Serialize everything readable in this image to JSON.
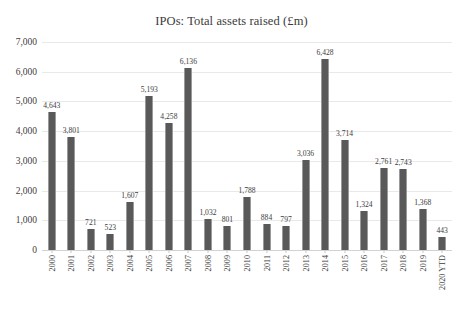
{
  "chart_data": {
    "type": "bar",
    "title": "IPOs: Total assets raised (£m)",
    "xlabel": "",
    "ylabel": "",
    "ylim": [
      0,
      7000
    ],
    "yticks": [
      0,
      1000,
      2000,
      3000,
      4000,
      5000,
      6000,
      7000
    ],
    "ytick_labels": [
      "0",
      "1,000",
      "2,000",
      "3,000",
      "4,000",
      "5,000",
      "6,000",
      "7,000"
    ],
    "grid": true,
    "legend": false,
    "bar_color": "#595959",
    "gridline_color": "#e9e9e9",
    "categories": [
      "2000",
      "2001",
      "2002",
      "2003",
      "2004",
      "2005",
      "2006",
      "2007",
      "2008",
      "2009",
      "2010",
      "2011",
      "2012",
      "2013",
      "2014",
      "2015",
      "2016",
      "2017",
      "2018",
      "2019",
      "2020 YTD"
    ],
    "values": [
      4643,
      3801,
      721,
      523,
      1607,
      5193,
      4258,
      6136,
      1032,
      801,
      1788,
      884,
      797,
      3036,
      6428,
      3714,
      1324,
      2761,
      2743,
      1368,
      443
    ],
    "value_labels": [
      "4,643",
      "3,801",
      "721",
      "523",
      "1,607",
      "5,193",
      "4,258",
      "6,136",
      "1,032",
      "801",
      "1,788",
      "884",
      "797",
      "3,036",
      "6,428",
      "3,714",
      "1,324",
      "2,761",
      "2,743",
      "1,368",
      "443"
    ]
  }
}
